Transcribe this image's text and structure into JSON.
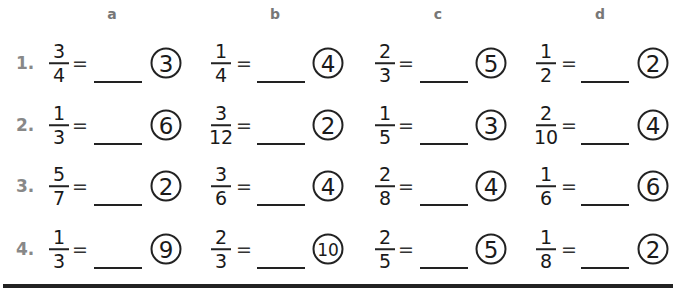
{
  "columns": [
    {
      "label": "a"
    },
    {
      "label": "b"
    },
    {
      "label": "c"
    },
    {
      "label": "d"
    }
  ],
  "rows": [
    {
      "number": "1.",
      "problems": [
        {
          "numerator": "3",
          "denominator": "4",
          "equals": "=",
          "circled": "3"
        },
        {
          "numerator": "1",
          "denominator": "4",
          "equals": "=",
          "circled": "4"
        },
        {
          "numerator": "2",
          "denominator": "3",
          "equals": "=",
          "circled": "5"
        },
        {
          "numerator": "1",
          "denominator": "2",
          "equals": "=",
          "circled": "2"
        }
      ]
    },
    {
      "number": "2.",
      "problems": [
        {
          "numerator": "1",
          "denominator": "3",
          "equals": "=",
          "circled": "6"
        },
        {
          "numerator": "3",
          "denominator": "12",
          "equals": "=",
          "circled": "2"
        },
        {
          "numerator": "1",
          "denominator": "5",
          "equals": "=",
          "circled": "3"
        },
        {
          "numerator": "2",
          "denominator": "10",
          "equals": "=",
          "circled": "4"
        }
      ]
    },
    {
      "number": "3.",
      "problems": [
        {
          "numerator": "5",
          "denominator": "7",
          "equals": "=",
          "circled": "2"
        },
        {
          "numerator": "3",
          "denominator": "6",
          "equals": "=",
          "circled": "4"
        },
        {
          "numerator": "2",
          "denominator": "8",
          "equals": "=",
          "circled": "4"
        },
        {
          "numerator": "1",
          "denominator": "6",
          "equals": "=",
          "circled": "6"
        }
      ]
    },
    {
      "number": "4.",
      "problems": [
        {
          "numerator": "1",
          "denominator": "3",
          "equals": "=",
          "circled": "9"
        },
        {
          "numerator": "2",
          "denominator": "3",
          "equals": "=",
          "circled": "10"
        },
        {
          "numerator": "2",
          "denominator": "5",
          "equals": "=",
          "circled": "5"
        },
        {
          "numerator": "1",
          "denominator": "8",
          "equals": "=",
          "circled": "2"
        }
      ]
    }
  ]
}
